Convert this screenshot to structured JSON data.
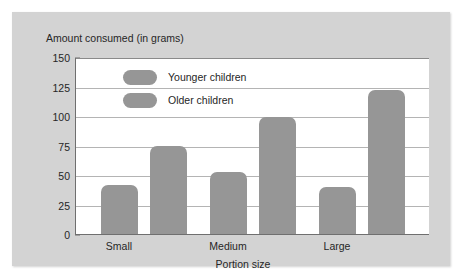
{
  "chart_data": {
    "type": "bar",
    "title": "Amount consumed (in grams)",
    "xlabel": "Portion size",
    "ylabel": "Amount consumed (in grams)",
    "categories": [
      "Small",
      "Medium",
      "Large"
    ],
    "series": [
      {
        "name": "Younger children",
        "values": [
          42,
          53,
          40
        ],
        "color": "#969696"
      },
      {
        "name": "Older children",
        "values": [
          75,
          100,
          123
        ],
        "color": "#969696"
      }
    ],
    "ylim": [
      0,
      150
    ],
    "yticks": [
      0,
      25,
      50,
      75,
      100,
      125,
      150
    ],
    "ytick_labels": [
      "0",
      "25",
      "50",
      "75",
      "100",
      "125",
      "150"
    ],
    "grid": true,
    "legend_position": "inside-top-left"
  },
  "legend": {
    "entries": [
      {
        "label": "Younger children"
      },
      {
        "label": "Older children"
      }
    ]
  },
  "axis": {
    "y_title": "Amount consumed (in grams)",
    "x_title": "Portion size",
    "tick_150": "150",
    "tick_125": "125",
    "tick_100": "100",
    "tick_75": "75",
    "tick_50": "50",
    "tick_25": "25",
    "tick_0": "0"
  },
  "categories": {
    "cat_0": "Small",
    "cat_1": "Medium",
    "cat_2": "Large"
  },
  "colors": {
    "bar": "#969696",
    "panel": "#d3d3d3",
    "plot_background": "#ffffff",
    "gridline": "#b4b4b4",
    "axis_line": "#6f6f6f",
    "text": "#262626"
  }
}
